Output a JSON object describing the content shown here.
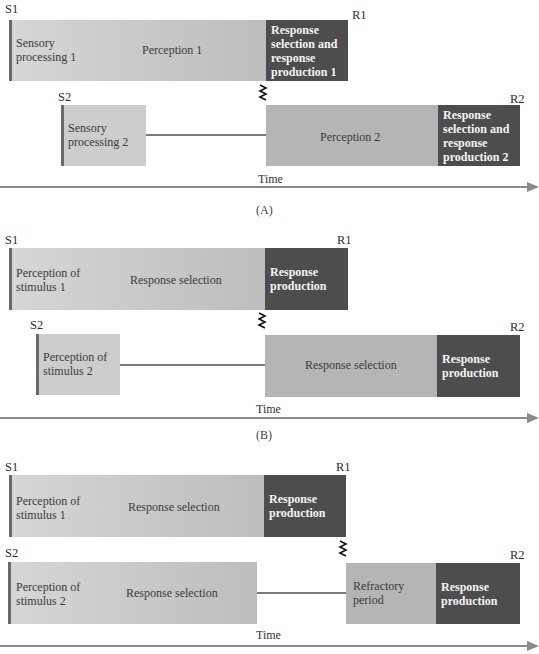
{
  "panels": [
    {
      "id": "A",
      "caption": "(A)",
      "s1": "S1",
      "r1": "R1",
      "s2": "S2",
      "r2": "R2",
      "time": "Time",
      "task1": {
        "stage1": "Sensory processing 1",
        "stage2": "Perception 1",
        "stage3": "Response selection and response production 1"
      },
      "task2": {
        "stage1": "Sensory processing 2",
        "stage2": "Perception 2",
        "stage3": "Response selection and response production 2"
      }
    },
    {
      "id": "B",
      "caption": "(B)",
      "s1": "S1",
      "r1": "R1",
      "s2": "S2",
      "r2": "R2",
      "time": "Time",
      "task1": {
        "stage1": "Perception of stimulus 1",
        "stage2": "Response selection",
        "stage3": "Response production"
      },
      "task2": {
        "stage1": "Perception of stimulus 2",
        "stage2": "Response selection",
        "stage3": "Response production"
      }
    },
    {
      "id": "C",
      "s1": "S1",
      "r1": "R1",
      "s2": "S2",
      "r2": "R2",
      "time": "Time",
      "task1": {
        "stage1": "Perception of stimulus 1",
        "stage2": "Response selection",
        "stage3": "Response production"
      },
      "task2": {
        "stage1": "Perception of stimulus 2",
        "stage2": "Response selection",
        "stage3": "Refractory period",
        "stage4": "Response production"
      }
    }
  ],
  "colors": {
    "light_stage": "#cfcfcf",
    "mid_stage": "#b5b5b5",
    "dark_stage": "#4d4d4d",
    "axis": "#8a8a8a"
  }
}
